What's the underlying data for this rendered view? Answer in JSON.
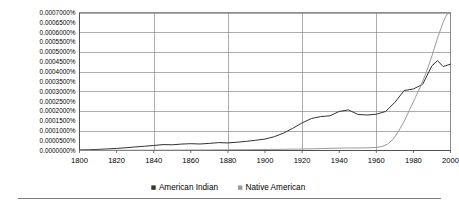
{
  "chart_data": {
    "type": "line",
    "title": "",
    "subtitle": "",
    "xlabel": "",
    "ylabel": "",
    "xlim": [
      1800,
      2000
    ],
    "ylim": [
      0.0,
      0.0007
    ],
    "grid": true,
    "legend_position": "bottom",
    "x_ticks": [
      1800,
      1820,
      1840,
      1860,
      1880,
      1900,
      1920,
      1940,
      1960,
      1980,
      2000
    ],
    "x_tick_labels": [
      "1800",
      "1820",
      "1840",
      "1860",
      "1880",
      "1900",
      "1920",
      "1940",
      "1960",
      "1980",
      "2000"
    ],
    "x_gridline_values": [
      1840,
      1880,
      1920,
      1960
    ],
    "y_ticks": [
      0.0,
      5e-05,
      0.0001,
      0.00015,
      0.0002,
      0.00025,
      0.0003,
      0.00035,
      0.0004,
      0.00045,
      0.0005,
      0.00055,
      0.0006,
      0.00065,
      0.0007
    ],
    "y_tick_labels": [
      "0.0000000%",
      "0.0000500%",
      "0.0001000%",
      "0.0001500%",
      "0.0002000%",
      "0.0002500%",
      "0.0003000%",
      "0.0003500%",
      "0.0004000%",
      "0.0004500%",
      "0.0005000%",
      "0.0005500%",
      "0.0006000%",
      "0.0006500%",
      "0.0007000%"
    ],
    "y_gridline_values": [
      0.0001,
      0.0002,
      0.0003,
      0.0004,
      0.0005,
      0.0006,
      0.0007
    ],
    "series": [
      {
        "name": "American Indian",
        "color": "#333333",
        "width": 1.0,
        "x": [
          1800,
          1805,
          1810,
          1815,
          1820,
          1825,
          1830,
          1835,
          1840,
          1845,
          1850,
          1855,
          1860,
          1865,
          1870,
          1875,
          1880,
          1885,
          1890,
          1895,
          1900,
          1905,
          1910,
          1915,
          1920,
          1925,
          1930,
          1935,
          1940,
          1945,
          1950,
          1955,
          1960,
          1965,
          1970,
          1975,
          1980,
          1985,
          1990,
          1993,
          1996,
          2000
        ],
        "values": [
          3e-06,
          4e-06,
          5.5e-06,
          8e-06,
          1.05e-05,
          1.4e-05,
          1.8e-05,
          2.15e-05,
          2.55e-05,
          3e-05,
          2.9e-05,
          3.25e-05,
          3.45e-05,
          3.3e-05,
          3.6e-05,
          4e-05,
          3.85e-05,
          4.2e-05,
          4.65e-05,
          5.2e-05,
          5.8e-05,
          7e-05,
          8.8e-05,
          0.000113,
          0.00014,
          0.000162,
          0.000172,
          0.000176,
          0.000198,
          0.000206,
          0.000183,
          0.00018,
          0.000184,
          0.000198,
          0.000244,
          0.000304,
          0.000312,
          0.000336,
          0.00043,
          0.000456,
          0.000426,
          0.000438
        ]
      },
      {
        "name": "Native American",
        "color": "#9a9a9a",
        "width": 1.0,
        "x": [
          1800,
          1810,
          1820,
          1830,
          1840,
          1850,
          1860,
          1870,
          1880,
          1890,
          1900,
          1910,
          1920,
          1930,
          1940,
          1945,
          1950,
          1955,
          1960,
          1963,
          1966,
          1969,
          1972,
          1975,
          1978,
          1981,
          1984,
          1987,
          1990,
          1993,
          1996,
          1998,
          2000
        ],
        "values": [
          8e-07,
          1e-06,
          1.2e-06,
          1.5e-06,
          1.8e-06,
          2e-06,
          2.5e-06,
          3e-06,
          3.5e-06,
          4.2e-06,
          5e-06,
          6e-06,
          7.5e-06,
          9.5e-06,
          1.2e-05,
          1.3e-05,
          1.25e-05,
          1.35e-05,
          1.55e-05,
          2e-05,
          3.2e-05,
          5.6e-05,
          9.8e-05,
          0.000148,
          0.000208,
          0.000268,
          0.000328,
          0.000398,
          0.00048,
          0.00057,
          0.00065,
          0.00069,
          0.0007
        ]
      }
    ],
    "legend": [
      {
        "label": "American Indian",
        "color": "#333333"
      },
      {
        "label": "Native American",
        "color": "#9a9a9a"
      }
    ]
  },
  "footer": {
    "rule_visible": true
  }
}
